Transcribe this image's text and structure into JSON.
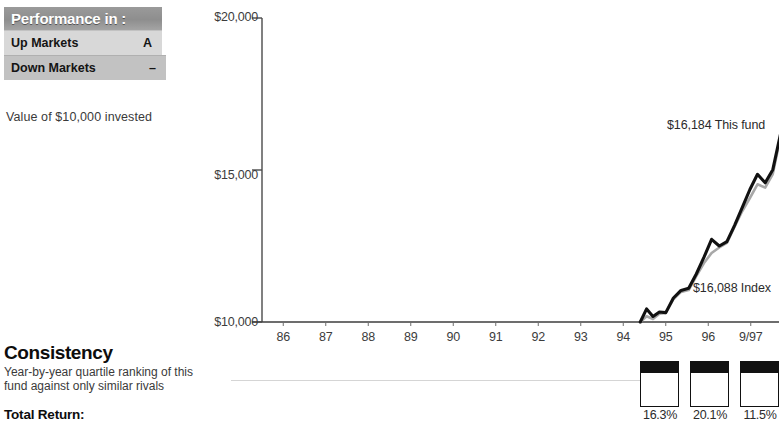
{
  "performance_box": {
    "header": "Performance in :",
    "rows": [
      {
        "label": "Up Markets",
        "grade": "A"
      },
      {
        "label": "Down Markets",
        "grade": "–"
      }
    ],
    "caption": "Value of $10,000 invested"
  },
  "consistency": {
    "title": "Consistency",
    "subtitle": "Year-by-year quartile ranking of this fund against only similar rivals",
    "total_return_label": "Total Return:",
    "quartiles": [
      {
        "rank": 1,
        "pct": "16.3%"
      },
      {
        "rank": 1,
        "pct": "20.1%"
      },
      {
        "rank": 1,
        "pct": "11.5%"
      }
    ]
  },
  "chart_data": {
    "type": "line",
    "title": "Value of $10,000 invested",
    "xlabel": "",
    "ylabel": "",
    "ylim": [
      10000,
      20000
    ],
    "yticks": [
      10000,
      15000,
      20000
    ],
    "ytick_labels": [
      "$10,000",
      "$15,000",
      "$20,000"
    ],
    "grid": false,
    "legend_position": "inline-annotation",
    "categories": [
      "86",
      "87",
      "88",
      "89",
      "90",
      "91",
      "92",
      "93",
      "94",
      "95",
      "96",
      "9/97"
    ],
    "annotations": [
      {
        "text": "$16,184 This fund",
        "series": "This fund",
        "value": 16184
      },
      {
        "text": "$16,088 Index",
        "series": "Index",
        "value": 16088
      }
    ],
    "x_start_year": 94.4,
    "series": [
      {
        "name": "This fund",
        "color": "#111111",
        "x": [
          94.4,
          94.55,
          94.7,
          94.85,
          95.0,
          95.18,
          95.36,
          95.54,
          95.72,
          95.9,
          96.08,
          96.26,
          96.44,
          96.62,
          96.8,
          96.98,
          97.16,
          97.34,
          97.52,
          97.7
        ],
        "values": [
          10000,
          10430,
          10180,
          10330,
          10310,
          10790,
          11040,
          11110,
          11580,
          12130,
          12720,
          12500,
          12640,
          13180,
          13760,
          14360,
          14860,
          14580,
          15010,
          16184
        ]
      },
      {
        "name": "Index",
        "color": "#a8a8a8",
        "x": [
          94.4,
          94.55,
          94.7,
          94.85,
          95.0,
          95.18,
          95.36,
          95.54,
          95.72,
          95.9,
          96.08,
          96.26,
          96.44,
          96.62,
          96.8,
          96.98,
          97.16,
          97.34,
          97.52,
          97.7
        ],
        "values": [
          10000,
          10190,
          10100,
          10270,
          10300,
          10750,
          10990,
          11050,
          11510,
          11940,
          12270,
          12450,
          12600,
          13130,
          13640,
          14080,
          14530,
          14420,
          14870,
          16088
        ]
      }
    ]
  }
}
